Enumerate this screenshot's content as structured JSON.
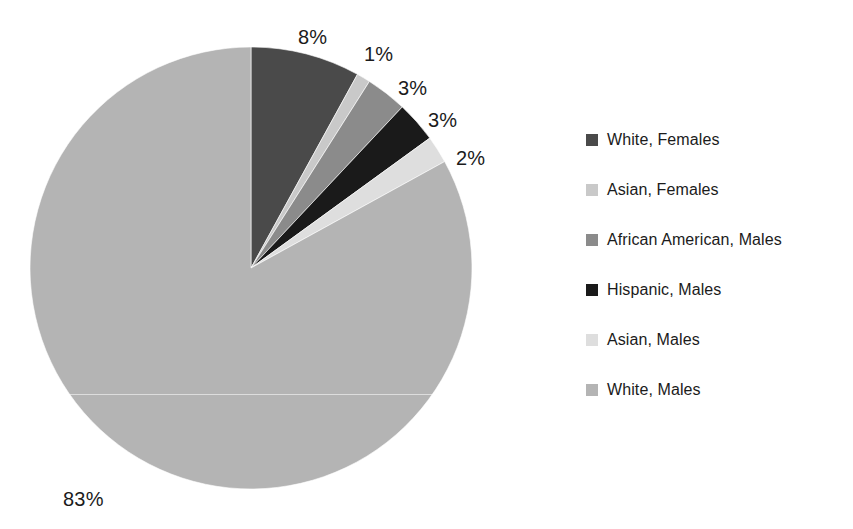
{
  "chart_data": {
    "type": "pie",
    "title": "",
    "subtitle": "",
    "xlabel": "",
    "ylabel": "",
    "grid": false,
    "legend_position": "right",
    "start_angle_deg": 0,
    "direction": "clockwise",
    "units": "percent",
    "categories": [
      "White, Females",
      "Asian, Females",
      "African American, Males",
      "Hispanic, Males",
      "Asian, Males",
      "White, Males"
    ],
    "values": [
      8,
      1,
      3,
      3,
      2,
      83
    ],
    "data_labels": [
      "8%",
      "1%",
      "3%",
      "3%",
      "2%",
      "83%"
    ],
    "colors": [
      "#4a4a4a",
      "#c9c9c9",
      "#8b8b8b",
      "#1a1a1a",
      "#dedede",
      "#b4b4b4"
    ],
    "slices": [
      {
        "label": "White, Females",
        "value": 8,
        "display": "8%",
        "color": "#4a4a4a"
      },
      {
        "label": "Asian, Females",
        "value": 1,
        "display": "1%",
        "color": "#c9c9c9"
      },
      {
        "label": "African American, Males",
        "value": 3,
        "display": "3%",
        "color": "#8b8b8b"
      },
      {
        "label": "Hispanic, Males",
        "value": 3,
        "display": "3%",
        "color": "#1a1a1a"
      },
      {
        "label": "Asian, Males",
        "value": 2,
        "display": "2%",
        "color": "#dedede"
      },
      {
        "label": "White, Males",
        "value": 83,
        "display": "83%",
        "color": "#b4b4b4"
      }
    ]
  },
  "pie": {
    "center_x": 251,
    "center_y": 268,
    "radius": 221,
    "labels": [
      {
        "text": "8%",
        "x": 298,
        "y": 27
      },
      {
        "text": "1%",
        "x": 364,
        "y": 44
      },
      {
        "text": "3%",
        "x": 398,
        "y": 78
      },
      {
        "text": "3%",
        "x": 428,
        "y": 110
      },
      {
        "text": "2%",
        "x": 456,
        "y": 148
      },
      {
        "text": "83%",
        "x": 63,
        "y": 489
      }
    ]
  },
  "legend": {
    "items": [
      {
        "label": "White, Females",
        "color": "#4a4a4a"
      },
      {
        "label": "Asian, Females",
        "color": "#c9c9c9"
      },
      {
        "label": "African American, Males",
        "color": "#8b8b8b"
      },
      {
        "label": "Hispanic, Males",
        "color": "#1a1a1a"
      },
      {
        "label": "Asian, Males",
        "color": "#dedede"
      },
      {
        "label": "White, Males",
        "color": "#b4b4b4"
      }
    ]
  },
  "colors": {
    "background": "#ffffff",
    "text": "#1b1b1b"
  }
}
